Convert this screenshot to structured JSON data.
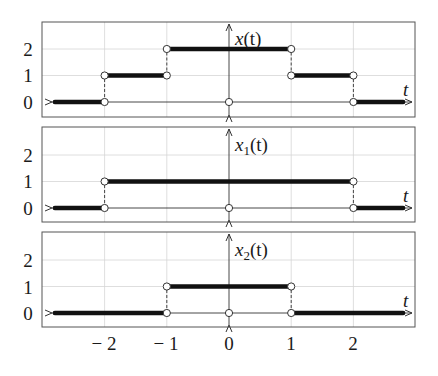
{
  "chart_data": [
    {
      "type": "line",
      "step": true,
      "title": "x(t)",
      "xlabel": "t",
      "ylabel": "x(t)",
      "xlim": [
        -3,
        3
      ],
      "ylim": [
        -0.4,
        3
      ],
      "yticks": [
        0,
        1,
        2
      ],
      "grid": true,
      "segments": [
        {
          "x": [
            -2.8,
            -2
          ],
          "y": 0
        },
        {
          "x": [
            -2,
            -1
          ],
          "y": 1
        },
        {
          "x": [
            -1,
            1
          ],
          "y": 2
        },
        {
          "x": [
            1,
            2
          ],
          "y": 1
        },
        {
          "x": [
            2,
            2.8
          ],
          "y": 0
        }
      ],
      "open_points": [
        [
          -2,
          0
        ],
        [
          -2,
          1
        ],
        [
          -1,
          1
        ],
        [
          -1,
          2
        ],
        [
          0,
          0
        ],
        [
          1,
          2
        ],
        [
          1,
          1
        ],
        [
          2,
          1
        ],
        [
          2,
          0
        ]
      ]
    },
    {
      "type": "line",
      "step": true,
      "title": "x1(t)",
      "xlabel": "t",
      "ylabel": "x1(t)",
      "xlim": [
        -3,
        3
      ],
      "ylim": [
        -0.4,
        3
      ],
      "yticks": [
        0,
        1,
        2
      ],
      "grid": true,
      "segments": [
        {
          "x": [
            -2.8,
            -2
          ],
          "y": 0
        },
        {
          "x": [
            -2,
            2
          ],
          "y": 1
        },
        {
          "x": [
            2,
            2.8
          ],
          "y": 0
        }
      ],
      "open_points": [
        [
          -2,
          0
        ],
        [
          -2,
          1
        ],
        [
          0,
          0
        ],
        [
          2,
          1
        ],
        [
          2,
          0
        ]
      ]
    },
    {
      "type": "line",
      "step": true,
      "title": "x2(t)",
      "xlabel": "t",
      "ylabel": "x2(t)",
      "xlim": [
        -3,
        3
      ],
      "ylim": [
        -0.4,
        3
      ],
      "xticks": [
        -2,
        -1,
        0,
        1,
        2
      ],
      "yticks": [
        0,
        1,
        2
      ],
      "grid": true,
      "segments": [
        {
          "x": [
            -2.8,
            -1
          ],
          "y": 0
        },
        {
          "x": [
            -1,
            1
          ],
          "y": 1
        },
        {
          "x": [
            1,
            2.8
          ],
          "y": 0
        }
      ],
      "open_points": [
        [
          -1,
          0
        ],
        [
          -1,
          1
        ],
        [
          0,
          0
        ],
        [
          1,
          1
        ],
        [
          1,
          0
        ]
      ]
    }
  ],
  "labels": {
    "panel1": {
      "func": "x",
      "sub": "",
      "arg": "(t)"
    },
    "panel2": {
      "func": "x",
      "sub": "1",
      "arg": "(t)"
    },
    "panel3": {
      "func": "x",
      "sub": "2",
      "arg": "(t)"
    },
    "t_axis": "t",
    "yticks": [
      "0",
      "1",
      "2"
    ],
    "xticks": [
      "− 2",
      "− 1",
      "0",
      "1",
      "2"
    ]
  }
}
